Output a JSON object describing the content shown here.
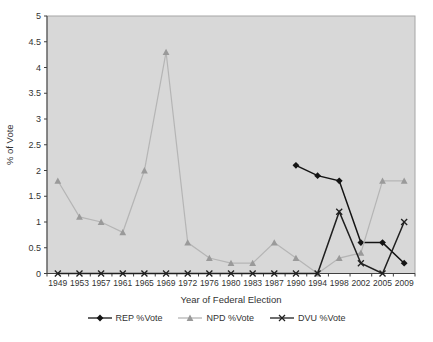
{
  "chart_data": {
    "type": "line",
    "title": "",
    "xlabel": "Year of Federal Election",
    "ylabel": "% of Vote",
    "ylim": [
      0,
      5
    ],
    "ytick_step": 0.5,
    "ytick_labels": [
      "0",
      "0.5",
      "1",
      "1.5",
      "2",
      "2.5",
      "3",
      "3.5",
      "4",
      "4.5",
      "5"
    ],
    "grid": false,
    "legend_position": "bottom",
    "plot_bg_color": "#d8d8d8",
    "plot_border_color": "#a6a6a6",
    "axis_color": "#404040",
    "categories": [
      "1949",
      "1953",
      "1957",
      "1961",
      "1965",
      "1969",
      "1972",
      "1976",
      "1980",
      "1983",
      "1987",
      "1990",
      "1994",
      "1998",
      "2002",
      "2005",
      "2009"
    ],
    "series": [
      {
        "name": "REP %Vote",
        "marker": "diamond",
        "color": "#141414",
        "marker_color": "#141414",
        "values": [
          null,
          null,
          null,
          null,
          null,
          null,
          null,
          null,
          null,
          null,
          null,
          2.1,
          1.9,
          1.8,
          0.6,
          0.6,
          0.2
        ]
      },
      {
        "name": "NPD %Vote",
        "marker": "triangle",
        "color": "#b5b5b5",
        "marker_color": "#9a9a9a",
        "values": [
          1.8,
          1.1,
          1.0,
          0.8,
          2.0,
          4.3,
          0.6,
          0.3,
          0.2,
          0.2,
          0.6,
          0.3,
          0,
          0.3,
          0.4,
          1.8,
          1.8
        ]
      },
      {
        "name": "DVU %Vote",
        "marker": "x",
        "color": "#202020",
        "marker_color": "#202020",
        "values": [
          0,
          0,
          0,
          0,
          0,
          0,
          0,
          0,
          0,
          0,
          0,
          0,
          0,
          1.2,
          0.2,
          0,
          1.0
        ]
      }
    ]
  }
}
